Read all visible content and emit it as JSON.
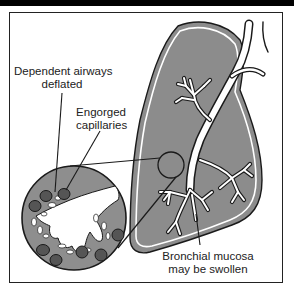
{
  "figure": {
    "type": "anatomical-diagram",
    "colors": {
      "lung_fill": "#8c8c8c",
      "airway": "#ffffff",
      "outline": "#1a1a1a",
      "capillary": "#555555",
      "inset_fill": "#8e8e8e",
      "background": "#ffffff",
      "top_bar": "#000000"
    }
  },
  "labels": {
    "dependent_airways_line1": "Dependent airways",
    "dependent_airways_line2": "deflated",
    "engorged_line1": "Engorged",
    "engorged_line2": "capillaries",
    "bronchial_line1": "Bronchial mucosa",
    "bronchial_line2": "may be swollen"
  }
}
